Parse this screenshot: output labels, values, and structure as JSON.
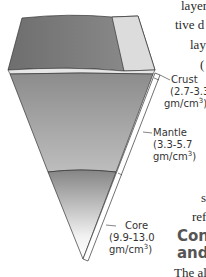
{
  "diagram": {
    "layers": [
      {
        "name": "Crust",
        "density": "(2.7-3.3",
        "unit": "gm/cm",
        "exp": "3",
        "close": ")"
      },
      {
        "name": "Mantle",
        "density": "(3.3-5.7",
        "unit": "gm/cm",
        "exp": "3",
        "close": ")"
      },
      {
        "name": "Core",
        "density": "(9.9-13.0",
        "unit": "gm/cm",
        "exp": "3",
        "close": ")"
      }
    ]
  },
  "body_text": {
    "line1": "layers",
    "line2": "tive d",
    "line3": "lay",
    "line4": "(",
    "line5": "s",
    "line6": "ref"
  },
  "section_heading": {
    "line1": "Cont",
    "line2": "and E"
  },
  "paragraph_start": "The al"
}
